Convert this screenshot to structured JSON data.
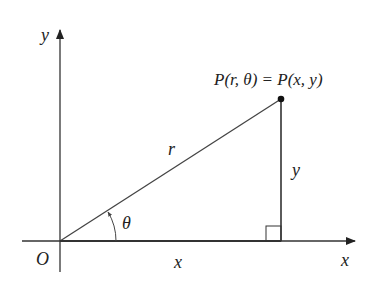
{
  "diagram": {
    "type": "polar-cartesian-relation",
    "labels": {
      "y_axis": "y",
      "x_axis": "x",
      "origin": "O",
      "point": "P(r, θ) = P(x, y)",
      "hypotenuse": "r",
      "vertical_leg": "y",
      "horizontal_leg": "x",
      "angle": "θ"
    },
    "colors": {
      "line": "#333333",
      "background": "#ffffff"
    }
  }
}
